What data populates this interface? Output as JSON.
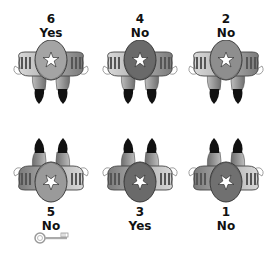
{
  "figures": [
    {
      "number": "6",
      "answer": "Yes",
      "orientation": "up",
      "head_color": "#a4a4a4",
      "row": 0,
      "col": 0
    },
    {
      "number": "4",
      "answer": "No",
      "orientation": "up",
      "head_color": "#6a6a6a",
      "row": 0,
      "col": 1
    },
    {
      "number": "2",
      "answer": "No",
      "orientation": "up",
      "head_color": "#8e8e8e",
      "row": 0,
      "col": 2
    },
    {
      "number": "5",
      "answer": "No",
      "orientation": "down",
      "head_color": "#9a9a9a",
      "row": 1,
      "col": 0
    },
    {
      "number": "3",
      "answer": "Yes",
      "orientation": "down",
      "head_color": "#6a6a6a",
      "row": 1,
      "col": 1
    },
    {
      "number": "1",
      "answer": "No",
      "orientation": "down",
      "head_color": "#707070",
      "row": 1,
      "col": 2
    }
  ],
  "key_icon": "key-icon"
}
